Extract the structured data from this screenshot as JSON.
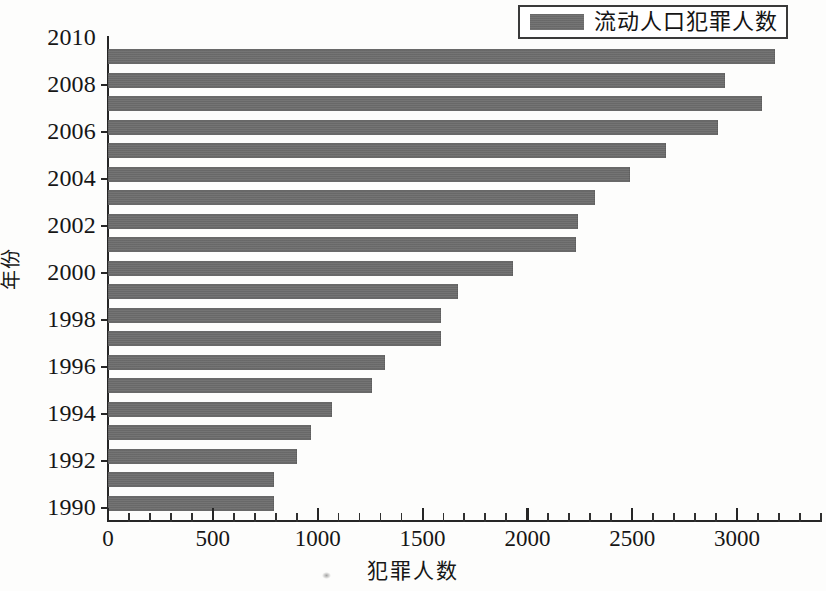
{
  "legend": {
    "label": "流动人口犯罪人数",
    "swatch_color": "#6e6e6e"
  },
  "axes": {
    "x_title": "犯罪人数",
    "y_title": "年份",
    "x_tick_labels": [
      "0",
      "500",
      "1000",
      "1500",
      "2000",
      "2500",
      "3000"
    ],
    "y_tick_labels": [
      "2010",
      "2008",
      "2006",
      "2004",
      "2002",
      "2000",
      "1998",
      "1996",
      "1994",
      "1992",
      "1990"
    ]
  },
  "chart_data": {
    "type": "bar",
    "orientation": "horizontal",
    "title": "",
    "xlabel": "犯罪人数",
    "ylabel": "年份",
    "xlim": [
      0,
      3400
    ],
    "ylim": [
      1989,
      2010
    ],
    "grid": false,
    "legend_position": "top-right",
    "series": [
      {
        "name": "流动人口犯罪人数",
        "color": "#6e6e6e",
        "categories": [
          2009,
          2008,
          2007,
          2006,
          2005,
          2004,
          2003,
          2002,
          2001,
          2000,
          1999,
          1998,
          1997,
          1996,
          1995,
          1994,
          1993,
          1992,
          1991,
          1990
        ],
        "values": [
          3180,
          2940,
          3120,
          2910,
          2660,
          2490,
          2320,
          2240,
          2230,
          1930,
          1670,
          1590,
          1590,
          1320,
          1260,
          1070,
          970,
          900,
          790,
          790
        ]
      }
    ]
  }
}
